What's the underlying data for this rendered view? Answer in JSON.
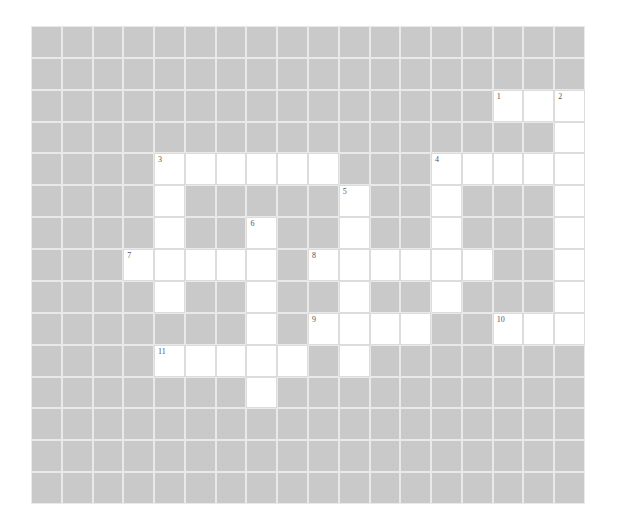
{
  "puzzle": {
    "rows": 15,
    "cols": 18,
    "colors": {
      "block": "#c9c9c9",
      "open": "#ffffff",
      "grid_line": "#e9e9e9",
      "number": "#555555"
    },
    "open_cells": [
      [
        2,
        15
      ],
      [
        2,
        16
      ],
      [
        2,
        17
      ],
      [
        3,
        17
      ],
      [
        4,
        4
      ],
      [
        4,
        5
      ],
      [
        4,
        6
      ],
      [
        4,
        7
      ],
      [
        4,
        8
      ],
      [
        4,
        9
      ],
      [
        4,
        13
      ],
      [
        4,
        14
      ],
      [
        4,
        15
      ],
      [
        4,
        16
      ],
      [
        4,
        17
      ],
      [
        5,
        4
      ],
      [
        5,
        10
      ],
      [
        5,
        13
      ],
      [
        5,
        17
      ],
      [
        6,
        4
      ],
      [
        6,
        7
      ],
      [
        6,
        10
      ],
      [
        6,
        13
      ],
      [
        6,
        17
      ],
      [
        7,
        3
      ],
      [
        7,
        4
      ],
      [
        7,
        5
      ],
      [
        7,
        6
      ],
      [
        7,
        7
      ],
      [
        7,
        9
      ],
      [
        7,
        10
      ],
      [
        7,
        11
      ],
      [
        7,
        12
      ],
      [
        7,
        13
      ],
      [
        7,
        14
      ],
      [
        7,
        17
      ],
      [
        8,
        4
      ],
      [
        8,
        7
      ],
      [
        8,
        10
      ],
      [
        8,
        13
      ],
      [
        8,
        17
      ],
      [
        9,
        7
      ],
      [
        9,
        9
      ],
      [
        9,
        10
      ],
      [
        9,
        11
      ],
      [
        9,
        12
      ],
      [
        9,
        15
      ],
      [
        9,
        16
      ],
      [
        9,
        17
      ],
      [
        10,
        4
      ],
      [
        10,
        5
      ],
      [
        10,
        6
      ],
      [
        10,
        7
      ],
      [
        10,
        8
      ],
      [
        10,
        10
      ],
      [
        11,
        7
      ]
    ],
    "clue_numbers": [
      {
        "row": 2,
        "col": 15,
        "label": "1"
      },
      {
        "row": 2,
        "col": 17,
        "label": "2"
      },
      {
        "row": 4,
        "col": 4,
        "label": "3"
      },
      {
        "row": 4,
        "col": 13,
        "label": "4"
      },
      {
        "row": 5,
        "col": 10,
        "label": "5"
      },
      {
        "row": 6,
        "col": 7,
        "label": "6"
      },
      {
        "row": 7,
        "col": 3,
        "label": "7"
      },
      {
        "row": 7,
        "col": 9,
        "label": "8"
      },
      {
        "row": 9,
        "col": 9,
        "label": "9"
      },
      {
        "row": 9,
        "col": 15,
        "label": "10"
      },
      {
        "row": 10,
        "col": 4,
        "label": "11"
      }
    ]
  }
}
